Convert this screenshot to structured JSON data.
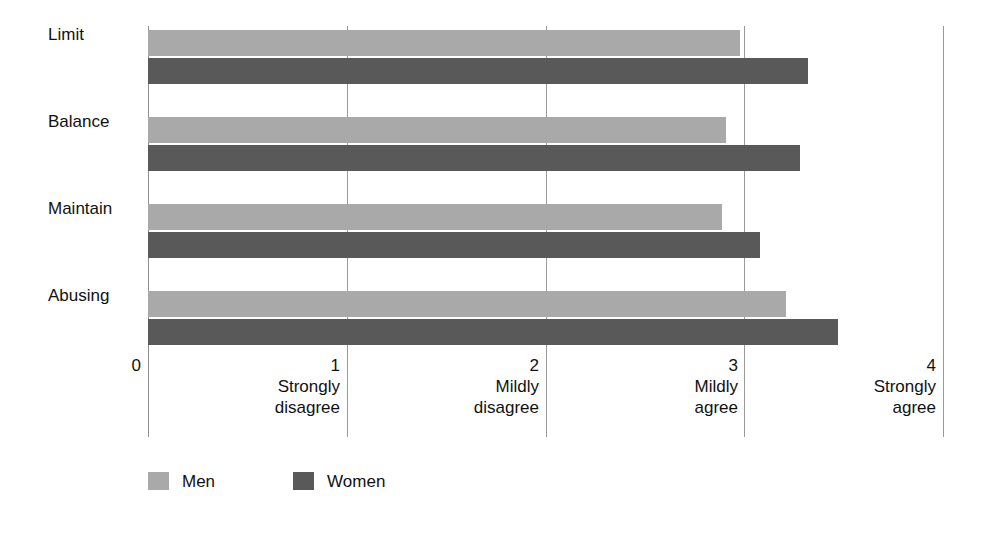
{
  "chart_data": {
    "type": "bar",
    "orientation": "horizontal",
    "title": "",
    "subtitle": "",
    "xlabel": "",
    "ylabel": "",
    "categories": [
      "Limit",
      "Balance",
      "Maintain",
      "Abusing"
    ],
    "series": [
      {
        "name": "Men",
        "color": "#a9a9a9",
        "values": [
          2.98,
          2.91,
          2.89,
          3.21
        ]
      },
      {
        "name": "Women",
        "color": "#595959",
        "values": [
          3.32,
          3.28,
          3.08,
          3.47
        ]
      }
    ],
    "xlim": [
      0,
      4
    ],
    "xticks": [
      0,
      1,
      2,
      3,
      4
    ],
    "xtick_labels": [
      "0",
      "1",
      "2",
      "3",
      "4"
    ],
    "xtick_captions": [
      {
        "line1": "",
        "line2": ""
      },
      {
        "line1": "Strongly",
        "line2": "disagree"
      },
      {
        "line1": "Mildly",
        "line2": "disagree"
      },
      {
        "line1": "Mildly",
        "line2": "agree"
      },
      {
        "line1": "Strongly",
        "line2": "agree"
      }
    ],
    "grid": true,
    "grid_axis": "x",
    "legend": [
      "Men",
      "Women"
    ],
    "legend_position": "bottom-left",
    "background": "#ffffff"
  },
  "axis": {
    "ticks": [
      {
        "value": "0",
        "caption_line1": "",
        "caption_line2": ""
      },
      {
        "value": "1",
        "caption_line1": "Strongly",
        "caption_line2": "disagree"
      },
      {
        "value": "2",
        "caption_line1": "Mildly",
        "caption_line2": "disagree"
      },
      {
        "value": "3",
        "caption_line1": "Mildly",
        "caption_line2": "agree"
      },
      {
        "value": "4",
        "caption_line1": "Strongly",
        "caption_line2": "agree"
      }
    ]
  },
  "categories": [
    {
      "label": "Limit"
    },
    {
      "label": "Balance"
    },
    {
      "label": "Maintain"
    },
    {
      "label": "Abusing"
    }
  ],
  "legend": {
    "items": [
      {
        "label": "Men",
        "color": "#a9a9a9"
      },
      {
        "label": "Women",
        "color": "#595959"
      }
    ]
  }
}
